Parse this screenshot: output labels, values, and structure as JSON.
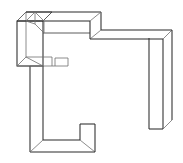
{
  "image": {
    "kind": "line-drawing",
    "subject": "wireframe-block-figure",
    "description": "Isometric outline drawing of an extruded C / F shaped solid block",
    "width": 183,
    "height": 163,
    "background_color": "#ffffff",
    "stroke_color": "#4a4a4a",
    "stroke_color_dark": "#2b2b2b",
    "stroke_color_light": "#6e6e6e",
    "stroke_width": 0.9,
    "fill_color": "#ffffff",
    "alt_text": "Thin grey outline drawing of a three dimensional block shaped like a letter C or F, shown in oblique projection with a short top arm extending to the right and a deeper arm below, plus a small rectangular tab on the inner left wall."
  },
  "geometry": {
    "projection": "oblique",
    "depth_offset": {
      "dx": 9,
      "dy": -9
    },
    "parts": [
      {
        "name": "left-vertical-band",
        "label": "Left upright slab"
      },
      {
        "name": "top-horizontal-band",
        "label": "Top cross bar"
      },
      {
        "name": "top-right-arm",
        "label": "Upper right arm"
      },
      {
        "name": "right-vertical-arm",
        "label": "Right descending arm"
      },
      {
        "name": "lower-left-upright",
        "label": "Lower left upright"
      },
      {
        "name": "bottom-band",
        "label": "Bottom cross bar"
      },
      {
        "name": "bottom-right-stub",
        "label": "Bottom right stub"
      },
      {
        "name": "inner-tab",
        "label": "Small inner tab"
      }
    ],
    "front_outline_points": "17,21 17,66 30,66 30,152 95,152 95,124 80,124 80,140 43,140 43,66 43,21",
    "top_outline_points": "26,12 101,12 101,30 172,30 172,120 158,120 158,38 90,38 90,21 26,21"
  },
  "annotations": {
    "has_text": false,
    "text_items": []
  }
}
